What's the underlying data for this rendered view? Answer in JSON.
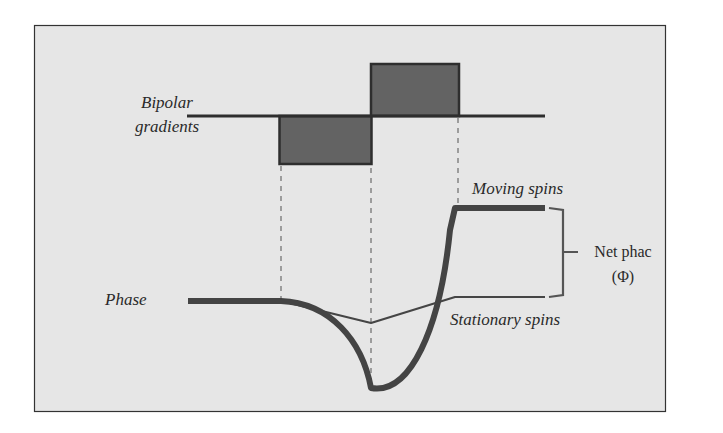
{
  "labels": {
    "bipolar_line1": "Bipolar",
    "bipolar_line2": "gradients",
    "phase": "Phase",
    "moving_spins": "Moving spins",
    "stationary_spins": "Stationary spins",
    "net_phase_line1": "Net phac",
    "net_phase_line2": "(Φ)"
  },
  "colors": {
    "background": "#e6e6e6",
    "frame": "#333333",
    "lobe_fill": "#636363",
    "line": "#2e2e2e",
    "dashed": "#8a8a8a"
  }
}
